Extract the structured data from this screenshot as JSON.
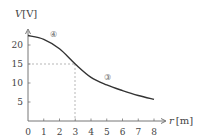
{
  "chart_data": {
    "type": "line",
    "title": "",
    "xlabel": "r [m]",
    "ylabel": "V [V]",
    "x_label_var": "r",
    "x_label_unit": "[m]",
    "y_label_var": "V",
    "y_label_unit": "[V]",
    "xlim": [
      0,
      8
    ],
    "ylim": [
      0,
      23
    ],
    "xticks": [
      "0",
      "1",
      "2",
      "3",
      "4",
      "5",
      "6",
      "7",
      "8"
    ],
    "yticks": [
      "5",
      "10",
      "15",
      "20"
    ],
    "grid": false,
    "series": [
      {
        "name": "V(r)",
        "x": [
          0,
          1,
          2,
          3,
          4,
          5,
          6,
          7,
          8
        ],
        "values": [
          22.5,
          21.5,
          19,
          15,
          11.5,
          9.5,
          8,
          6.7,
          5.7
        ]
      }
    ],
    "annotations": [
      {
        "type": "dashed-guide",
        "x": 3,
        "y": 15
      },
      {
        "type": "region-label",
        "text": "④",
        "x": 2.2,
        "y": 21
      },
      {
        "type": "region-label",
        "text": "③",
        "x": 5.5,
        "y": 10.5
      }
    ]
  },
  "labels": {
    "y_axis": "V [V]",
    "x_axis": "r [m]",
    "region_4": "④",
    "region_3": "③"
  }
}
